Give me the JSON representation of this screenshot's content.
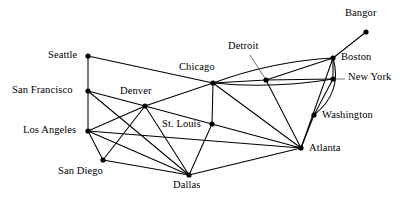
{
  "figure": {
    "kind": "network-graph",
    "background_color": "#ffffff",
    "line_color": "#000000",
    "node_color": "#000000",
    "width": 414,
    "height": 202
  },
  "nodes": [
    {
      "id": "bangor",
      "label": "Bangor",
      "x": 366,
      "y": 32,
      "label_x": 345,
      "label_y": 8,
      "leader": false
    },
    {
      "id": "boston",
      "label": "Boston",
      "x": 333,
      "y": 58,
      "label_x": 341,
      "label_y": 52,
      "leader": false
    },
    {
      "id": "newyork",
      "label": "New York",
      "x": 333,
      "y": 79,
      "label_x": 348,
      "label_y": 72,
      "leader": true,
      "leader_x": 345,
      "leader_y": 79
    },
    {
      "id": "detroit",
      "label": "Detroit",
      "x": 266,
      "y": 80,
      "label_x": 228,
      "label_y": 41,
      "leader": true,
      "leader_x": 250,
      "leader_y": 55
    },
    {
      "id": "chicago",
      "label": "Chicago",
      "x": 213,
      "y": 83,
      "label_x": 179,
      "label_y": 62,
      "leader": false
    },
    {
      "id": "washington",
      "label": "Washington",
      "x": 314,
      "y": 115,
      "label_x": 322,
      "label_y": 110,
      "leader": false
    },
    {
      "id": "denver",
      "label": "Denver",
      "x": 145,
      "y": 106,
      "label_x": 120,
      "label_y": 86,
      "leader": false
    },
    {
      "id": "stlouis",
      "label": "St. Louis",
      "x": 212,
      "y": 124,
      "label_x": 162,
      "label_y": 119,
      "leader": false
    },
    {
      "id": "seattle",
      "label": "Seattle",
      "x": 88,
      "y": 56,
      "label_x": 48,
      "label_y": 50,
      "leader": false
    },
    {
      "id": "sanfrancisco",
      "label": "San Francisco",
      "x": 88,
      "y": 91,
      "label_x": 12,
      "label_y": 85,
      "leader": false
    },
    {
      "id": "losangeles",
      "label": "Los Angeles",
      "x": 88,
      "y": 131,
      "label_x": 23,
      "label_y": 125,
      "leader": false
    },
    {
      "id": "sandiego",
      "label": "San Diego",
      "x": 103,
      "y": 160,
      "label_x": 58,
      "label_y": 166,
      "leader": false
    },
    {
      "id": "atlanta",
      "label": "Atlanta",
      "x": 301,
      "y": 148,
      "label_x": 309,
      "label_y": 143,
      "leader": false
    },
    {
      "id": "dallas",
      "label": "Dallas",
      "x": 189,
      "y": 175,
      "label_x": 173,
      "label_y": 180,
      "leader": false
    }
  ],
  "edges": [
    {
      "from": "bangor",
      "to": "boston",
      "type": "straight"
    },
    {
      "from": "seattle",
      "to": "sanfrancisco",
      "type": "straight"
    },
    {
      "from": "seattle",
      "to": "chicago",
      "type": "straight"
    },
    {
      "from": "sanfrancisco",
      "to": "losangeles",
      "type": "straight"
    },
    {
      "from": "sanfrancisco",
      "to": "denver",
      "type": "straight"
    },
    {
      "from": "sanfrancisco",
      "to": "dallas",
      "type": "straight"
    },
    {
      "from": "losangeles",
      "to": "sandiego",
      "type": "straight"
    },
    {
      "from": "losangeles",
      "to": "denver",
      "type": "straight"
    },
    {
      "from": "losangeles",
      "to": "dallas",
      "type": "straight"
    },
    {
      "from": "losangeles",
      "to": "atlanta",
      "type": "straight"
    },
    {
      "from": "sandiego",
      "to": "denver",
      "type": "straight"
    },
    {
      "from": "sandiego",
      "to": "dallas",
      "type": "straight"
    },
    {
      "from": "denver",
      "to": "chicago",
      "type": "straight"
    },
    {
      "from": "denver",
      "to": "stlouis",
      "type": "straight"
    },
    {
      "from": "denver",
      "to": "dallas",
      "type": "straight"
    },
    {
      "from": "chicago",
      "to": "stlouis",
      "type": "straight"
    },
    {
      "from": "chicago",
      "to": "detroit",
      "type": "straight"
    },
    {
      "from": "chicago",
      "to": "atlanta",
      "type": "straight"
    },
    {
      "from": "chicago",
      "to": "boston",
      "type": "curve",
      "curve_x": 273,
      "curve_y": 61
    },
    {
      "from": "chicago",
      "to": "newyork",
      "type": "curve",
      "curve_x": 273,
      "curve_y": 89
    },
    {
      "from": "stlouis",
      "to": "dallas",
      "type": "straight"
    },
    {
      "from": "stlouis",
      "to": "atlanta",
      "type": "straight"
    },
    {
      "from": "dallas",
      "to": "atlanta",
      "type": "straight"
    },
    {
      "from": "detroit",
      "to": "boston",
      "type": "straight"
    },
    {
      "from": "detroit",
      "to": "newyork",
      "type": "straight"
    },
    {
      "from": "detroit",
      "to": "atlanta",
      "type": "straight"
    },
    {
      "from": "boston",
      "to": "newyork",
      "type": "straight"
    },
    {
      "from": "boston",
      "to": "washington",
      "type": "curve",
      "curve_x": 343,
      "curve_y": 92
    },
    {
      "from": "boston",
      "to": "atlanta",
      "type": "straight"
    },
    {
      "from": "newyork",
      "to": "washington",
      "type": "straight"
    },
    {
      "from": "washington",
      "to": "atlanta",
      "type": "straight"
    }
  ]
}
